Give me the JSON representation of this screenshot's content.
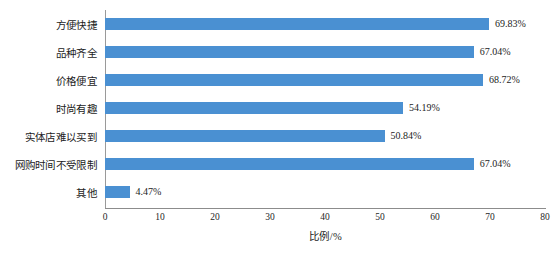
{
  "chart_data": {
    "type": "bar",
    "orientation": "horizontal",
    "title": "",
    "xlabel": "比例/%",
    "ylabel": "",
    "xlim": [
      0,
      80
    ],
    "xticks": [
      0,
      10,
      20,
      30,
      40,
      50,
      60,
      70,
      80
    ],
    "grid": false,
    "legend": null,
    "bar_color": "#4a90d2",
    "categories": [
      "方便快捷",
      "品种齐全",
      "价格便宜",
      "时尚有趣",
      "实体店难以买到",
      "网购时间不受限制",
      "其他"
    ],
    "values": [
      69.83,
      67.04,
      68.72,
      54.19,
      50.84,
      67.04,
      4.47
    ],
    "value_labels": [
      "69.83%",
      "67.04%",
      "68.72%",
      "54.19%",
      "50.84%",
      "67.04%",
      "4.47%"
    ]
  }
}
